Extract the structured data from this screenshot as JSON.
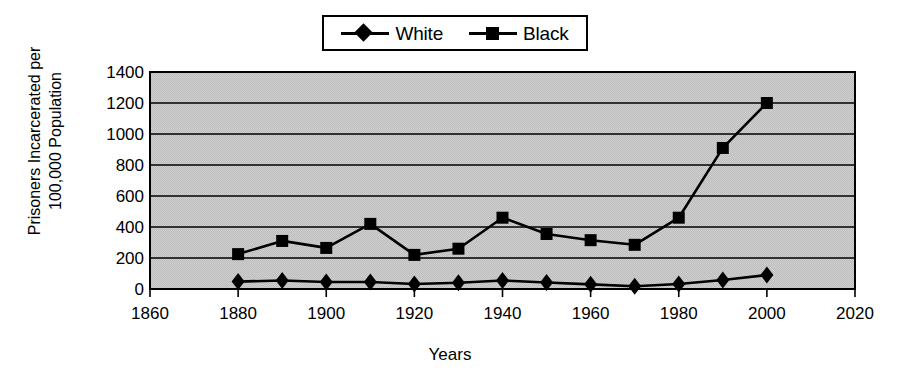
{
  "chart_data": {
    "type": "line",
    "title": "",
    "xlabel": "Years",
    "ylabel": "Prisoners Incarcerated per 100,000 Population",
    "ylabel_line1": "Prisoners Incarcerated per",
    "ylabel_line2": "100,000 Population",
    "xlim": [
      1860,
      2020
    ],
    "ylim": [
      0,
      1400
    ],
    "xticks": [
      1860,
      1880,
      1900,
      1920,
      1940,
      1960,
      1980,
      2000,
      2020
    ],
    "yticks": [
      0,
      200,
      400,
      600,
      800,
      1000,
      1200,
      1400
    ],
    "grid": "horizontal",
    "legend_position": "top-center",
    "plot_background": "#c9c9c9",
    "line_color": "#000000",
    "x": [
      1880,
      1890,
      1900,
      1910,
      1920,
      1930,
      1940,
      1950,
      1960,
      1970,
      1980,
      1990,
      2000
    ],
    "series": [
      {
        "name": "White",
        "marker": "diamond",
        "values": [
          48,
          55,
          45,
          45,
          32,
          40,
          55,
          42,
          30,
          18,
          32,
          58,
          90
        ]
      },
      {
        "name": "Black",
        "marker": "square",
        "values": [
          225,
          310,
          265,
          420,
          220,
          260,
          460,
          355,
          315,
          285,
          460,
          910,
          1200
        ]
      }
    ]
  },
  "legend": {
    "entries": [
      {
        "label": "White",
        "marker": "diamond"
      },
      {
        "label": "Black",
        "marker": "square"
      }
    ]
  },
  "axis": {
    "x_title": "Years",
    "y_title_line1": "Prisoners Incarcerated per",
    "y_title_line2": "100,000 Population"
  }
}
